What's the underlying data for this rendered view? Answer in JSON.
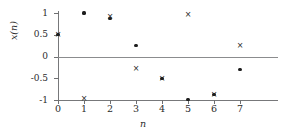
{
  "chart_data": {
    "type": "scatter",
    "title": "",
    "xlabel": "n",
    "ylabel": "x(n)",
    "x": [
      0,
      1,
      2,
      3,
      4,
      5,
      6,
      7
    ],
    "xlim": [
      -0.4,
      8.4
    ],
    "ylim": [
      -1.12,
      1.12
    ],
    "grid": false,
    "legend_position": "none",
    "xticks": [
      "0",
      "1",
      "2",
      "3",
      "4",
      "5",
      "6",
      "7"
    ],
    "yticks": [
      "1",
      "0.5",
      "0",
      "-0.5",
      "-1"
    ],
    "ytick_values": [
      1,
      0.5,
      0,
      -0.5,
      -1
    ],
    "reference_lines": [
      0,
      -1
    ],
    "series": [
      {
        "name": "dot-series",
        "marker": "dot",
        "color": "#1d1d1d",
        "values": [
          0.5,
          1.0,
          0.87,
          0.25,
          -0.5,
          -0.98,
          -0.88,
          -0.3
        ]
      },
      {
        "name": "cross-series",
        "marker": "x",
        "color": "#1d1d1d",
        "values": [
          0.5,
          -0.97,
          0.9,
          -0.28,
          -0.51,
          0.95,
          -0.88,
          0.23
        ]
      }
    ]
  },
  "axis": {
    "x_title": "n",
    "y_title": "x(n)"
  },
  "markers": {
    "cross_glyph": "×"
  }
}
